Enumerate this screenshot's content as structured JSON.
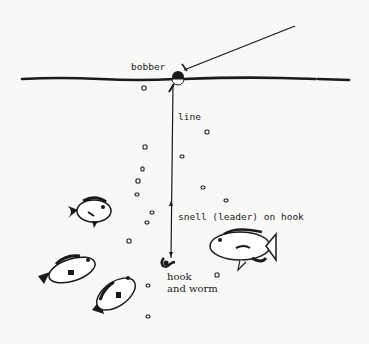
{
  "diagram": {
    "labels": {
      "bobber": "bobber",
      "line": "line",
      "snell": "snell (leader) on hook",
      "hook_line1": "hook",
      "hook_line2": "and worm"
    },
    "elements": [
      {
        "name": "water-surface",
        "description": "horizontal water surface line"
      },
      {
        "name": "fishing-rod-line",
        "description": "line rising from bobber to upper right"
      },
      {
        "name": "bobber",
        "description": "black and white float at surface"
      },
      {
        "name": "vertical-line",
        "description": "line hanging down from bobber"
      },
      {
        "name": "snell-leader",
        "description": "short leader above hook"
      },
      {
        "name": "hook-and-worm",
        "description": "baited hook at bottom of line"
      },
      {
        "name": "fish",
        "count": 4,
        "description": "sunfish/bluegill swimming near bait"
      },
      {
        "name": "bubbles",
        "description": "small bubbles rising in water"
      }
    ],
    "colors": {
      "ink": "#1a1a1a",
      "paper": "#f8f8f6"
    }
  }
}
